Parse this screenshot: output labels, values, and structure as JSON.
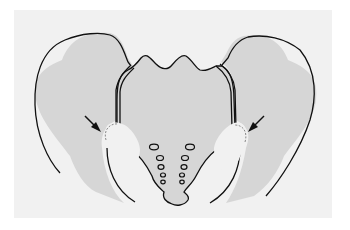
{
  "figure": {
    "type": "anatomical-illustration",
    "colors": {
      "background": "#ffffff",
      "panel": "#f1f1f1",
      "bone_fill": "#d6d6d6",
      "joint_fill": "#f1f1f1",
      "outline": "#111111",
      "dashed_outline": "#8a8a8a",
      "arrow": "#111111"
    },
    "structures": [
      {
        "name": "left-ilium"
      },
      {
        "name": "right-ilium"
      },
      {
        "name": "sacrum"
      },
      {
        "name": "left-sacroiliac-joint"
      },
      {
        "name": "right-sacroiliac-joint"
      }
    ],
    "annotations": [
      {
        "type": "arrow",
        "target": "left-joint-region"
      },
      {
        "type": "arrow",
        "target": "right-joint-region"
      }
    ]
  }
}
